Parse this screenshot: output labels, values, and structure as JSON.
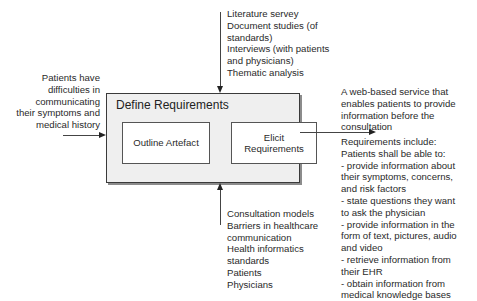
{
  "input": {
    "lines": [
      "Patients have",
      "difficulties in",
      "communicating",
      "their symptoms and",
      "medical history"
    ]
  },
  "controls": {
    "lines": [
      "Literature servey",
      "Document studies (of",
      "standards)",
      "Interviews (with patients",
      "and physicians)",
      "Thematic analysis"
    ]
  },
  "activity": {
    "title": "Define Requirements",
    "sub_activities": [
      {
        "label": "Outline Artefact"
      },
      {
        "label_line1": "Elicit",
        "label_line2": "Requirements"
      }
    ]
  },
  "mechanisms": {
    "lines": [
      "Consultation models",
      "Barriers in healthcare",
      "communication",
      "Health informatics",
      "standards",
      "Patients",
      "Physicians"
    ]
  },
  "output": {
    "summary_lines": [
      "A web-based service that",
      "enables patients to provide",
      "information before the",
      "consultation"
    ],
    "requirements_lines": [
      "Requirements include:",
      "Patients shall be able to:",
      "- provide information about",
      "their symptoms, concerns,",
      "and risk factors",
      "- state questions they want",
      "to ask the physician",
      "- provide information in the",
      "form of text, pictures, audio",
      "and video",
      "- retrieve information from",
      "their EHR",
      "- obtain information from",
      "medical knowledge bases"
    ]
  }
}
